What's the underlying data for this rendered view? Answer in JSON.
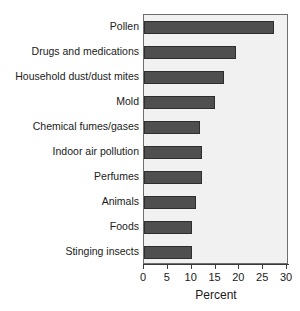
{
  "chart_data": {
    "type": "bar",
    "orientation": "horizontal",
    "title": "",
    "xlabel": "Percent",
    "ylabel": "",
    "xlim": [
      0,
      30
    ],
    "xticks": [
      0,
      5,
      10,
      15,
      20,
      25,
      30
    ],
    "grid": false,
    "legend": null,
    "categories": [
      "Pollen",
      "Drugs and medications",
      "Household dust/dust mites",
      "Mold",
      "Chemical fumes/gases",
      "Indoor air pollution",
      "Perfumes",
      "Animals",
      "Foods",
      "Stinging insects"
    ],
    "values": [
      27.3,
      19.3,
      16.8,
      14.9,
      11.8,
      12.2,
      12.2,
      11.0,
      10.1,
      10.1
    ],
    "colors": {
      "bar_fill": "#4f4f4f",
      "bar_border": "#2e2e2e",
      "plot_background": "#f1f1f1",
      "plot_border": "#6e6e6e",
      "axis": "#3a3a3a",
      "text": "#1a1a1a",
      "page_background": "#ffffff"
    }
  }
}
